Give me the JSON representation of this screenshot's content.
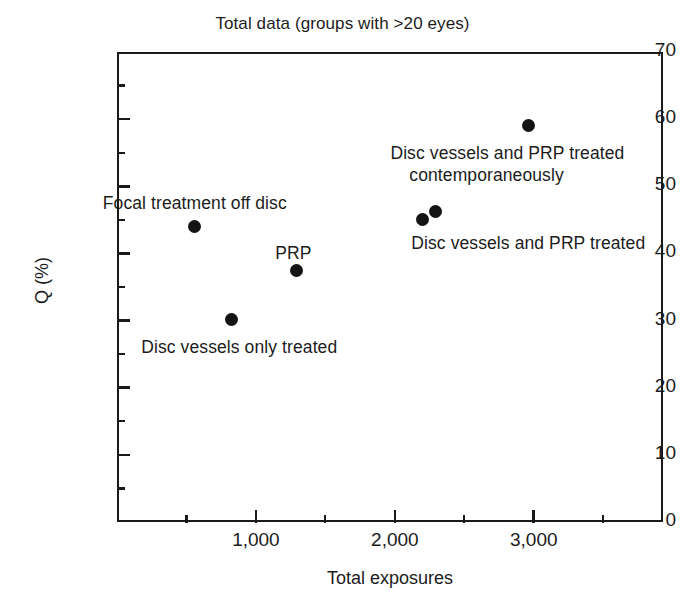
{
  "chart_data": {
    "type": "scatter",
    "title": "Total data (groups with >20 eyes)",
    "xlabel": "Total exposures",
    "ylabel": "Q (%)",
    "xlim": [
      0,
      3930
    ],
    "ylim": [
      0,
      70
    ],
    "grid": false,
    "legend": "none",
    "x_major_ticks": [
      1000,
      2000,
      3000
    ],
    "x_major_tick_labels": [
      "1,000",
      "2,000",
      "3,000"
    ],
    "x_minor_ticks": [
      500,
      1500,
      2500,
      3500
    ],
    "y_major_ticks": [
      0,
      10,
      20,
      30,
      40,
      50,
      60,
      70
    ],
    "y_major_tick_labels": [
      "0",
      "10",
      "20",
      "30",
      "40",
      "50",
      "60",
      "70"
    ],
    "y_minor_ticks": [
      5,
      15,
      25,
      35,
      45,
      55,
      65
    ],
    "points": [
      {
        "x": 560,
        "y": 44.0,
        "label": "Focal treatment off disc"
      },
      {
        "x": 825,
        "y": 30.2,
        "label": "Disc vessels only treated"
      },
      {
        "x": 1290,
        "y": 37.5,
        "label": "PRP"
      },
      {
        "x": 2200,
        "y": 45.0,
        "label": "Disc vessels and PRP treated"
      },
      {
        "x": 2290,
        "y": 46.3,
        "label": "Disc vessels and PRP treated"
      },
      {
        "x": 2960,
        "y": 59.1,
        "label": "Disc vessels and PRP treated contemporaneously"
      }
    ],
    "annotations": [
      {
        "text": "Focal treatment off disc",
        "x": 560,
        "y": 47.5,
        "align": "center"
      },
      {
        "text": "Disc vessels only treated",
        "x": 880,
        "y": 26.0,
        "align": "center"
      },
      {
        "text": "PRP",
        "x": 1270,
        "y": 40.0,
        "align": "center"
      },
      {
        "text": "Disc vessels and PRP treated",
        "x": 2960,
        "y": 41.5,
        "align": "center"
      },
      {
        "text": "Disc vessels and PRP treated",
        "x": 2810,
        "y": 55.0,
        "align": "center"
      },
      {
        "text": "contemporaneously",
        "x": 2660,
        "y": 51.7,
        "align": "center"
      }
    ],
    "colors": {
      "marker": "#141414",
      "axis": "#1a1a1a",
      "text": "#1c1c1c",
      "background": "#ffffff"
    }
  }
}
